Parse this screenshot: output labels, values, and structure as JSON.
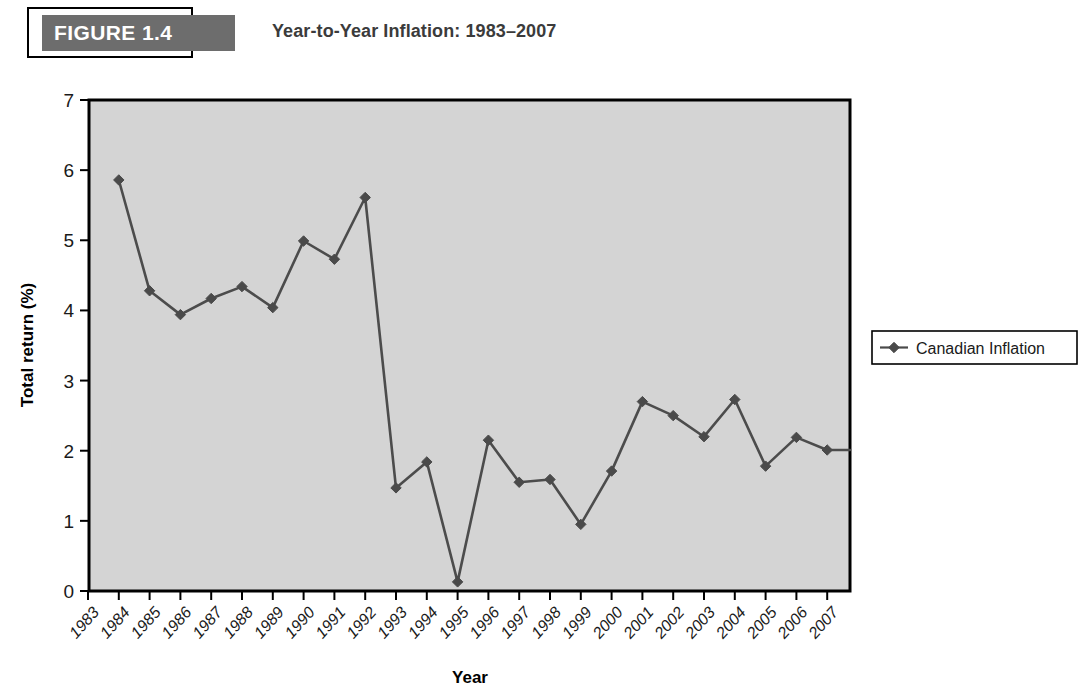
{
  "figure": {
    "tag": "FIGURE 1.4",
    "title": "Year-to-Year Inflation: 1983–2007",
    "tag_bar_color": "#6d6d6d",
    "title_color": "#3b3b3b"
  },
  "chart_data": {
    "type": "line",
    "title": "Year-to-Year Inflation: 1983–2007",
    "xlabel": "Year",
    "ylabel": "Total return (%)",
    "xlim": [
      "1983",
      "2008"
    ],
    "ylim": [
      0,
      7
    ],
    "ytick_labels": [
      "0",
      "1",
      "2",
      "3",
      "4",
      "5",
      "6",
      "7"
    ],
    "yticks": [
      0,
      1,
      2,
      3,
      4,
      5,
      6,
      7
    ],
    "grid": false,
    "plot_background": "#d4d4d4",
    "series_color": "#4a4a4a",
    "marker": "diamond",
    "legend_position": "right-outside",
    "categories": [
      "1983",
      "1984",
      "1985",
      "1986",
      "1987",
      "1988",
      "1989",
      "1990",
      "1991",
      "1992",
      "1993",
      "1994",
      "1995",
      "1996",
      "1997",
      "1998",
      "1999",
      "2000",
      "2001",
      "2002",
      "2003",
      "2004",
      "2005",
      "2006",
      "2007"
    ],
    "series": [
      {
        "name": "Canadian Inflation",
        "values": [
          null,
          5.86,
          4.28,
          3.94,
          4.17,
          4.34,
          4.04,
          4.99,
          4.73,
          5.61,
          1.47,
          1.84,
          0.13,
          2.15,
          1.55,
          1.59,
          0.95,
          1.71,
          2.7,
          2.5,
          2.2,
          2.73,
          1.78,
          2.19,
          2.01
        ]
      }
    ],
    "legend": [
      {
        "label": "Canadian Inflation",
        "color": "#4a4a4a",
        "marker": "diamond"
      }
    ]
  },
  "axes": {
    "y_title": "Total return (%)",
    "x_title": "Year"
  }
}
